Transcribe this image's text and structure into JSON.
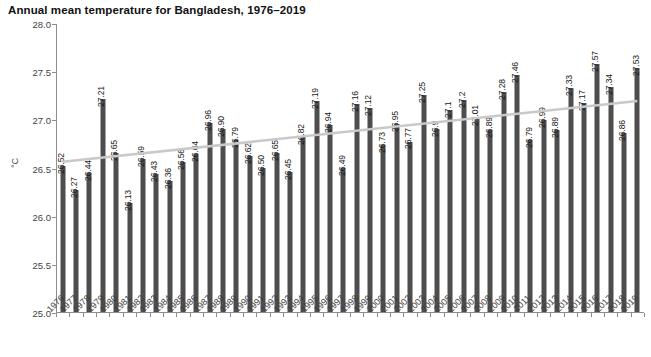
{
  "chart_data": {
    "type": "bar",
    "title": "Annual mean temperature for Bangladesh, 1976–2019",
    "xlabel": "",
    "ylabel": "°C",
    "ylim": [
      25.0,
      28.0
    ],
    "ytick_labels": [
      "25.0",
      "25.5",
      "26.0",
      "26.5",
      "27.0",
      "27.5",
      "28.0"
    ],
    "ytick_values": [
      25.0,
      25.5,
      26.0,
      26.5,
      27.0,
      27.5,
      28.0
    ],
    "grid": false,
    "legend": "none",
    "bar_color": "#4d4d4d",
    "trendline_color": "#c9c9c9",
    "trendline": {
      "type": "linear",
      "y_start": 26.57,
      "y_end": 27.2
    },
    "categories": [
      "1976",
      "1977",
      "1978",
      "1979",
      "1980",
      "1981",
      "1982",
      "1983",
      "1984",
      "1985",
      "1986",
      "1987",
      "1988",
      "1989",
      "1990",
      "1991",
      "1992",
      "1993",
      "1994",
      "1995",
      "1996",
      "1997",
      "1998",
      "1999",
      "2000",
      "2001",
      "2002",
      "2003",
      "2004",
      "2005",
      "2006",
      "2007",
      "2008",
      "2009",
      "2010",
      "2011",
      "2012",
      "2013",
      "2014",
      "2015",
      "2016",
      "2017",
      "2018",
      "2019"
    ],
    "values": [
      26.52,
      26.27,
      26.44,
      27.21,
      26.65,
      26.13,
      26.59,
      26.43,
      26.36,
      26.56,
      26.64,
      26.96,
      26.9,
      26.79,
      26.62,
      26.5,
      26.65,
      26.45,
      26.82,
      27.19,
      26.94,
      26.49,
      27.16,
      27.12,
      26.73,
      26.95,
      26.77,
      27.25,
      26.9,
      27.1,
      27.2,
      27.01,
      26.89,
      27.28,
      27.46,
      26.79,
      26.99,
      26.89,
      27.33,
      27.17,
      27.57,
      27.34,
      26.86,
      27.53
    ],
    "value_labels": [
      "26.52",
      "26.27",
      "26.44",
      "27.21",
      "26.65",
      "26.13",
      "26.59",
      "26.43",
      "26.36",
      "26.56",
      "26.64",
      "26.96",
      "26.90",
      "26.79",
      "26.62",
      "26.50",
      "26.65",
      "26.45",
      "26.82",
      "27.19",
      "26.94",
      "26.49",
      "27.16",
      "27.12",
      "26.73",
      "26.95",
      "26.77",
      "27.25",
      "26.9",
      "27.1",
      "27.2",
      "27.01",
      "26.89",
      "27.28",
      "27.46",
      "26.79",
      "26.99",
      "26.89",
      "27.33",
      "27.17",
      "27.57",
      "27.34",
      "26.86",
      "27.53"
    ]
  }
}
